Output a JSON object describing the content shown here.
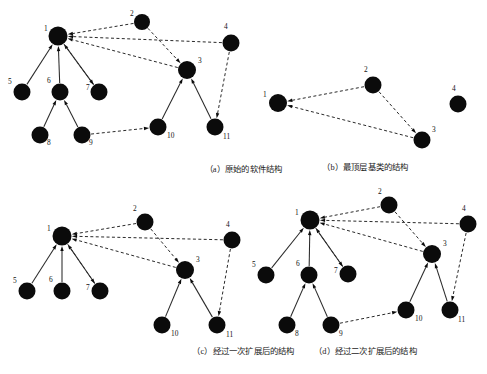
{
  "figure": {
    "background": "#ffffff",
    "node_color": "#0b0b0b",
    "edge_color": "#2a2a2a"
  },
  "panels": [
    {
      "id": "a",
      "caption": "（a）原始的软件结构",
      "nodes": [
        {
          "label": "1",
          "x": 58,
          "y": 36,
          "r": 9.5,
          "lx": 44,
          "ly": 31
        },
        {
          "label": "2",
          "x": 142,
          "y": 22,
          "r": 8.0,
          "lx": 130,
          "ly": 16
        },
        {
          "label": "3",
          "x": 187,
          "y": 70,
          "r": 9.0,
          "lx": 198,
          "ly": 63
        },
        {
          "label": "4",
          "x": 231,
          "y": 43,
          "r": 8.5,
          "lx": 224,
          "ly": 29
        },
        {
          "label": "5",
          "x": 22,
          "y": 92,
          "r": 8.5,
          "lx": 8,
          "ly": 84
        },
        {
          "label": "6",
          "x": 60,
          "y": 92,
          "r": 8.5,
          "lx": 47,
          "ly": 83
        },
        {
          "label": "7",
          "x": 99,
          "y": 92,
          "r": 8.5,
          "lx": 86,
          "ly": 90
        },
        {
          "label": "8",
          "x": 40,
          "y": 135,
          "r": 8.5,
          "lx": 47,
          "ly": 145
        },
        {
          "label": "9",
          "x": 82,
          "y": 135,
          "r": 8.5,
          "lx": 89,
          "ly": 145
        },
        {
          "label": "10",
          "x": 158,
          "y": 127,
          "r": 8.5,
          "lx": 167,
          "ly": 138
        },
        {
          "label": "11",
          "x": 215,
          "y": 127,
          "r": 8.5,
          "lx": 223,
          "ly": 139
        }
      ],
      "edges": [
        {
          "from": "5",
          "to": "1",
          "style": "solid"
        },
        {
          "from": "6",
          "to": "1",
          "style": "solid"
        },
        {
          "from": "7",
          "to": "1",
          "style": "solid"
        },
        {
          "from": "8",
          "to": "6",
          "style": "solid"
        },
        {
          "from": "9",
          "to": "6",
          "style": "solid"
        },
        {
          "from": "10",
          "to": "3",
          "style": "solid"
        },
        {
          "from": "11",
          "to": "3",
          "style": "solid"
        },
        {
          "from": "2",
          "to": "1",
          "style": "dashed"
        },
        {
          "from": "2",
          "to": "3",
          "style": "dashed"
        },
        {
          "from": "4",
          "to": "1",
          "style": "dashed"
        },
        {
          "from": "3",
          "to": "1",
          "style": "dashed"
        },
        {
          "from": "1",
          "to": "7",
          "style": "dashed"
        },
        {
          "from": "4",
          "to": "11",
          "style": "dashed"
        },
        {
          "from": "9",
          "to": "10",
          "style": "dashed"
        }
      ]
    },
    {
      "id": "b",
      "caption": "（b）最顶层基类的结构",
      "nodes": [
        {
          "label": "1",
          "x": 278,
          "y": 103,
          "r": 9.0,
          "lx": 263,
          "ly": 97
        },
        {
          "label": "2",
          "x": 373,
          "y": 85,
          "r": 8.5,
          "lx": 364,
          "ly": 72
        },
        {
          "label": "3",
          "x": 422,
          "y": 140,
          "r": 8.5,
          "lx": 432,
          "ly": 132
        },
        {
          "label": "4",
          "x": 458,
          "y": 104,
          "r": 8.5,
          "lx": 452,
          "ly": 91
        }
      ],
      "edges": [
        {
          "from": "2",
          "to": "1",
          "style": "dashed"
        },
        {
          "from": "2",
          "to": "3",
          "style": "dashed"
        },
        {
          "from": "3",
          "to": "1",
          "style": "dashed"
        }
      ]
    },
    {
      "id": "c",
      "caption": "（c）经过一次扩展后的结构",
      "nodes": [
        {
          "label": "1",
          "x": 62,
          "y": 236,
          "r": 9.5,
          "lx": 47,
          "ly": 231
        },
        {
          "label": "2",
          "x": 145,
          "y": 222,
          "r": 8.5,
          "lx": 133,
          "ly": 211
        },
        {
          "label": "3",
          "x": 185,
          "y": 270,
          "r": 9.0,
          "lx": 196,
          "ly": 262
        },
        {
          "label": "4",
          "x": 232,
          "y": 240,
          "r": 8.5,
          "lx": 226,
          "ly": 227
        },
        {
          "label": "5",
          "x": 27,
          "y": 291,
          "r": 8.5,
          "lx": 13,
          "ly": 283
        },
        {
          "label": "6",
          "x": 62,
          "y": 291,
          "r": 8.5,
          "lx": 49,
          "ly": 282
        },
        {
          "label": "7",
          "x": 100,
          "y": 291,
          "r": 8.5,
          "lx": 86,
          "ly": 290
        },
        {
          "label": "10",
          "x": 162,
          "y": 325,
          "r": 8.5,
          "lx": 171,
          "ly": 336
        },
        {
          "label": "11",
          "x": 217,
          "y": 325,
          "r": 8.5,
          "lx": 226,
          "ly": 337
        }
      ],
      "edges": [
        {
          "from": "5",
          "to": "1",
          "style": "solid"
        },
        {
          "from": "6",
          "to": "1",
          "style": "solid"
        },
        {
          "from": "7",
          "to": "1",
          "style": "solid"
        },
        {
          "from": "10",
          "to": "3",
          "style": "solid"
        },
        {
          "from": "11",
          "to": "3",
          "style": "solid"
        },
        {
          "from": "2",
          "to": "1",
          "style": "dashed"
        },
        {
          "from": "2",
          "to": "3",
          "style": "dashed"
        },
        {
          "from": "4",
          "to": "1",
          "style": "dashed"
        },
        {
          "from": "3",
          "to": "1",
          "style": "dashed"
        },
        {
          "from": "1",
          "to": "7",
          "style": "dashed"
        },
        {
          "from": "4",
          "to": "11",
          "style": "dashed"
        }
      ]
    },
    {
      "id": "d",
      "caption": "（d）经过二次扩展后的结构",
      "nodes": [
        {
          "label": "1",
          "x": 310,
          "y": 220,
          "r": 9.5,
          "lx": 295,
          "ly": 215
        },
        {
          "label": "2",
          "x": 389,
          "y": 205,
          "r": 8.5,
          "lx": 378,
          "ly": 194
        },
        {
          "label": "3",
          "x": 432,
          "y": 254,
          "r": 9.0,
          "lx": 443,
          "ly": 246
        },
        {
          "label": "4",
          "x": 468,
          "y": 224,
          "r": 8.5,
          "lx": 462,
          "ly": 211
        },
        {
          "label": "5",
          "x": 266,
          "y": 275,
          "r": 8.5,
          "lx": 252,
          "ly": 267
        },
        {
          "label": "6",
          "x": 309,
          "y": 275,
          "r": 8.5,
          "lx": 296,
          "ly": 266
        },
        {
          "label": "7",
          "x": 348,
          "y": 274,
          "r": 8.5,
          "lx": 334,
          "ly": 273
        },
        {
          "label": "8",
          "x": 287,
          "y": 325,
          "r": 8.5,
          "lx": 295,
          "ly": 336
        },
        {
          "label": "9",
          "x": 331,
          "y": 325,
          "r": 8.5,
          "lx": 339,
          "ly": 336
        },
        {
          "label": "10",
          "x": 406,
          "y": 310,
          "r": 8.5,
          "lx": 415,
          "ly": 321
        },
        {
          "label": "11",
          "x": 450,
          "y": 310,
          "r": 8.5,
          "lx": 458,
          "ly": 322
        }
      ],
      "edges": [
        {
          "from": "5",
          "to": "1",
          "style": "solid"
        },
        {
          "from": "6",
          "to": "1",
          "style": "solid"
        },
        {
          "from": "7",
          "to": "1",
          "style": "solid"
        },
        {
          "from": "8",
          "to": "6",
          "style": "solid"
        },
        {
          "from": "9",
          "to": "6",
          "style": "solid"
        },
        {
          "from": "10",
          "to": "3",
          "style": "solid"
        },
        {
          "from": "11",
          "to": "3",
          "style": "solid"
        },
        {
          "from": "2",
          "to": "1",
          "style": "dashed"
        },
        {
          "from": "2",
          "to": "3",
          "style": "dashed"
        },
        {
          "from": "4",
          "to": "1",
          "style": "dashed"
        },
        {
          "from": "3",
          "to": "1",
          "style": "dashed"
        },
        {
          "from": "1",
          "to": "7",
          "style": "dashed"
        },
        {
          "from": "4",
          "to": "11",
          "style": "dashed"
        },
        {
          "from": "9",
          "to": "10",
          "style": "dashed"
        }
      ]
    }
  ],
  "caption_positions": [
    {
      "id": "a",
      "x": 0,
      "y": 162
    },
    {
      "id": "b",
      "x": 244,
      "y": 160
    },
    {
      "id": "c",
      "x": 0,
      "y": 344
    },
    {
      "id": "d",
      "x": 244,
      "y": 344
    }
  ]
}
